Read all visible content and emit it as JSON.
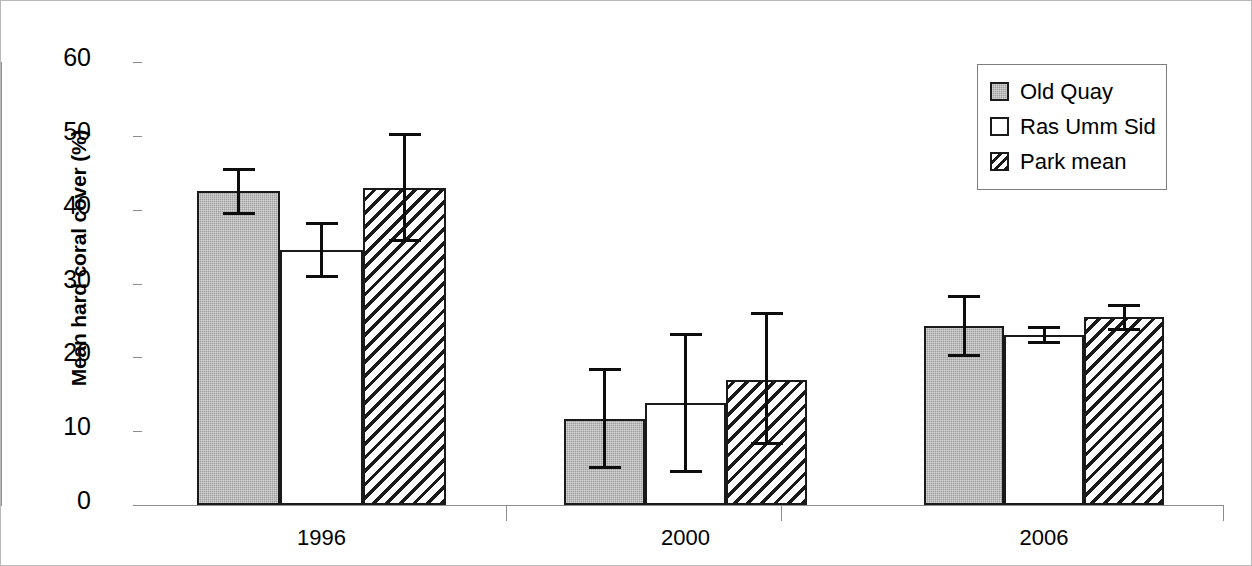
{
  "chart_data": {
    "type": "bar",
    "title": "",
    "xlabel": "",
    "ylabel": "Mean hard coral cover (%)",
    "categories": [
      "1996",
      "2000",
      "2006"
    ],
    "ylim": [
      0,
      60
    ],
    "yticks": [
      0,
      10,
      20,
      30,
      40,
      50,
      60
    ],
    "ytick_labels": [
      "0",
      "10",
      "20",
      "30",
      "40",
      "50",
      "60"
    ],
    "grid": false,
    "legend_position": "top-right",
    "error_bars": "symmetric",
    "series": [
      {
        "name": "Old Quay",
        "fill": "solid-gray",
        "color": "#9E9E9E",
        "values": [
          42.5,
          11.7,
          24.2
        ],
        "errors": [
          3.2,
          6.8,
          4.2
        ],
        "upper": [
          45.7,
          18.5,
          28.4
        ],
        "lower": [
          39.3,
          4.9,
          20.0
        ]
      },
      {
        "name": "Ras Umm Sid",
        "fill": "white",
        "color": "#FFFFFF",
        "values": [
          34.5,
          13.8,
          23.0
        ],
        "errors": [
          3.8,
          9.5,
          1.2
        ],
        "upper": [
          38.3,
          23.3,
          24.2
        ],
        "lower": [
          30.7,
          4.3,
          21.8
        ]
      },
      {
        "name": "Park mean",
        "fill": "hatch",
        "color": "#FFFFFF",
        "values": [
          43.0,
          16.9,
          25.4
        ],
        "errors": [
          7.4,
          8.9,
          1.8
        ],
        "upper": [
          50.4,
          26.1,
          27.2
        ],
        "lower": [
          35.6,
          8.1,
          23.6
        ]
      }
    ]
  },
  "legend": {
    "entries": [
      {
        "label": "Old Quay",
        "swatch": "solid-gray"
      },
      {
        "label": "Ras Umm Sid",
        "swatch": "white"
      },
      {
        "label": "Park mean",
        "swatch": "hatch"
      }
    ]
  },
  "axes": {
    "y_axis_title": "Mean hard coral cover (%)",
    "y_tick_labels": [
      "60",
      "50",
      "40",
      "30",
      "20",
      "10",
      "0"
    ],
    "x_tick_labels": [
      "1996",
      "2000",
      "2006"
    ]
  }
}
